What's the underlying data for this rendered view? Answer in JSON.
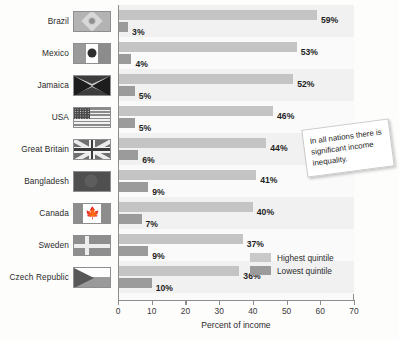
{
  "chart_data": {
    "type": "bar",
    "orientation": "horizontal",
    "title": "",
    "xlabel": "Percent of income",
    "ylabel": "",
    "xlim": [
      0,
      70
    ],
    "xticks": [
      0,
      10,
      20,
      30,
      40,
      50,
      60,
      70
    ],
    "grid": false,
    "legend_position": "inside-bottom-right",
    "categories": [
      "Brazil",
      "Mexico",
      "Jamaica",
      "USA",
      "Great Britain",
      "Bangladesh",
      "Canada",
      "Sweden",
      "Czech Republic"
    ],
    "series": [
      {
        "name": "Highest quintile",
        "color": "#c4c4c4",
        "values": [
          59,
          53,
          52,
          46,
          44,
          41,
          40,
          37,
          36
        ],
        "labels": [
          "59%",
          "53%",
          "52%",
          "46%",
          "44%",
          "41%",
          "40%",
          "37%",
          "36%"
        ]
      },
      {
        "name": "Lowest quintile",
        "color": "#9b9b9b",
        "values": [
          3,
          4,
          5,
          5,
          6,
          9,
          7,
          9,
          10
        ],
        "labels": [
          "3%",
          "4%",
          "5%",
          "5%",
          "6%",
          "9%",
          "7%",
          "9%",
          "10%"
        ]
      }
    ],
    "annotations": [
      {
        "text": "In all nations there is significant income inequality."
      }
    ],
    "category_icons": [
      "flag-brazil",
      "flag-mexico",
      "flag-jamaica",
      "flag-usa",
      "flag-great-britain",
      "flag-bangladesh",
      "flag-canada",
      "flag-sweden",
      "flag-czech-republic"
    ]
  },
  "axis": {
    "xlabel": "Percent of income",
    "ticks": [
      "0",
      "10",
      "20",
      "30",
      "40",
      "50",
      "60",
      "70"
    ]
  },
  "legend": {
    "items": [
      {
        "label": "Highest quintile",
        "swatch": "#c4c4c4"
      },
      {
        "label": "Lowest quintile",
        "swatch": "#9b9b9b"
      }
    ]
  },
  "callout": {
    "text": "In all nations there is significant income inequality."
  },
  "rows": [
    {
      "country": "Brazil",
      "flag": "flag-brazil",
      "highest": "59%",
      "lowest": "3%"
    },
    {
      "country": "Mexico",
      "flag": "flag-mexico",
      "highest": "53%",
      "lowest": "4%"
    },
    {
      "country": "Jamaica",
      "flag": "flag-jamaica",
      "highest": "52%",
      "lowest": "5%"
    },
    {
      "country": "USA",
      "flag": "flag-usa",
      "highest": "46%",
      "lowest": "5%"
    },
    {
      "country": "Great Britain",
      "flag": "flag-great-britain",
      "highest": "44%",
      "lowest": "6%"
    },
    {
      "country": "Bangladesh",
      "flag": "flag-bangladesh",
      "highest": "41%",
      "lowest": "9%"
    },
    {
      "country": "Canada",
      "flag": "flag-canada",
      "highest": "40%",
      "lowest": "7%"
    },
    {
      "country": "Sweden",
      "flag": "flag-sweden",
      "highest": "37%",
      "lowest": "9%"
    },
    {
      "country": "Czech Republic",
      "flag": "flag-czech-republic",
      "highest": "36%",
      "lowest": "10%"
    }
  ],
  "colors": {
    "highest_quintile": "#c4c4c4",
    "lowest_quintile": "#9b9b9b",
    "plot_band": "#f1f1f1",
    "axis": "#8d8d8d"
  }
}
